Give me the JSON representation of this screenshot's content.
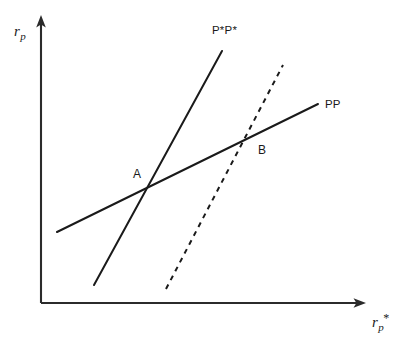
{
  "figure": {
    "width": 404,
    "height": 341,
    "background_color": "#ffffff",
    "line_color": "#1a1a1a",
    "axis_color": "#2b2b2b"
  },
  "axes": {
    "y_label_base": "r",
    "y_label_sub": "p",
    "x_label_base": "r",
    "x_label_sub": "p",
    "x_label_sup": "*",
    "origin": [
      41,
      303
    ],
    "y_axis_tip": [
      41,
      17
    ],
    "x_axis_tip": [
      365,
      303
    ],
    "ticks": [],
    "gridlines": false
  },
  "chart_data": {
    "type": "line",
    "title": "",
    "subtitle": "",
    "xlabel": "r_p*",
    "ylabel": "r_p",
    "xlim": [
      41,
      365
    ],
    "ylim": [
      17,
      303
    ],
    "grid": false,
    "legend": "inline-annotations",
    "axis_style": "arrow-axes-no-ticks",
    "series": [
      {
        "name": "PP",
        "label": "PP",
        "style": "solid",
        "description": "Flatter upward-sloping schedule (home policy reaction function)",
        "points": [
          [
            57,
            232
          ],
          [
            318,
            104
          ]
        ],
        "label_position": [
          325,
          107
        ]
      },
      {
        "name": "P*P*",
        "label": "P*P*",
        "style": "solid",
        "description": "Steeper upward-sloping schedule (foreign policy reaction function)",
        "points": [
          [
            94,
            285
          ],
          [
            222,
            51
          ]
        ],
        "label_position": [
          212,
          33
        ]
      },
      {
        "name": "P*P* shifted",
        "label": "",
        "style": "dashed",
        "description": "Dashed steep schedule shifted to the right of P*P*",
        "points": [
          [
            166,
            289
          ],
          [
            283,
            65
          ]
        ],
        "label_position": null
      }
    ],
    "annotations": [
      {
        "label": "A",
        "description": "Intersection of PP and P*P*",
        "point": [
          147,
          184
        ],
        "label_position": [
          133,
          176
        ]
      },
      {
        "label": "B",
        "description": "Intersection of PP and the shifted dashed schedule",
        "point": [
          243,
          146
        ],
        "label_position": [
          258,
          152
        ]
      }
    ]
  }
}
